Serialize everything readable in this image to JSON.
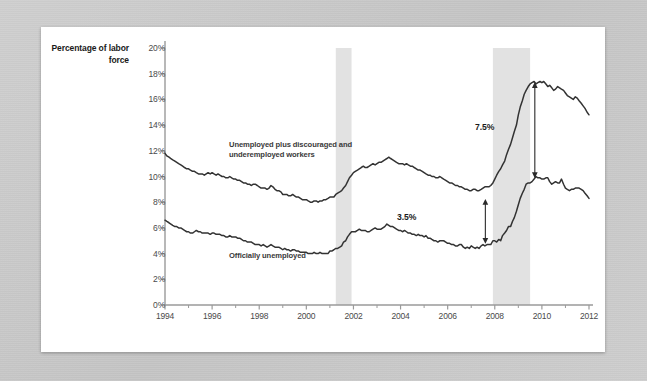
{
  "chart_data": {
    "type": "line",
    "title": "",
    "ylabel": "Percentage of labor force",
    "xlabel": "",
    "ylim": [
      0,
      20
    ],
    "xlim": [
      1994,
      2012
    ],
    "grid": false,
    "legend_position": "inline-annotations",
    "ytick_labels": [
      "0%",
      "2%",
      "4%",
      "6%",
      "8%",
      "10%",
      "12%",
      "14%",
      "16%",
      "18%",
      "20%"
    ],
    "ytick_values": [
      0,
      2,
      4,
      6,
      8,
      10,
      12,
      14,
      16,
      18,
      20
    ],
    "xtick_labels": [
      "1994",
      "1996",
      "1998",
      "2000",
      "2002",
      "2004",
      "2006",
      "2008",
      "2010",
      "2012"
    ],
    "xtick_values": [
      1994,
      1996,
      1998,
      2000,
      2002,
      2004,
      2006,
      2008,
      2010,
      2012
    ],
    "xtick_minor_values": [
      1995,
      1997,
      1999,
      2001,
      2003,
      2005,
      2007,
      2009,
      2011
    ],
    "series": [
      {
        "name": "Unemployed plus discouraged and underemployed workers",
        "color": "#333333",
        "x": [
          1994.0,
          1994.08,
          1994.17,
          1994.25,
          1994.33,
          1994.42,
          1994.5,
          1994.58,
          1994.67,
          1994.75,
          1994.83,
          1994.92,
          1995.0,
          1995.08,
          1995.17,
          1995.25,
          1995.33,
          1995.42,
          1995.5,
          1995.58,
          1995.67,
          1995.75,
          1995.83,
          1995.92,
          1996.0,
          1996.08,
          1996.17,
          1996.25,
          1996.33,
          1996.42,
          1996.5,
          1996.58,
          1996.67,
          1996.75,
          1996.83,
          1996.92,
          1997.0,
          1997.08,
          1997.17,
          1997.25,
          1997.33,
          1997.42,
          1997.5,
          1997.58,
          1997.67,
          1997.75,
          1997.83,
          1997.92,
          1998.0,
          1998.08,
          1998.17,
          1998.25,
          1998.33,
          1998.42,
          1998.5,
          1998.58,
          1998.67,
          1998.75,
          1998.83,
          1998.92,
          1999.0,
          1999.08,
          1999.17,
          1999.25,
          1999.33,
          1999.42,
          1999.5,
          1999.58,
          1999.67,
          1999.75,
          1999.83,
          1999.92,
          2000.0,
          2000.08,
          2000.17,
          2000.25,
          2000.33,
          2000.42,
          2000.5,
          2000.58,
          2000.67,
          2000.75,
          2000.83,
          2000.92,
          2001.0,
          2001.08,
          2001.17,
          2001.25,
          2001.33,
          2001.42,
          2001.5,
          2001.58,
          2001.67,
          2001.75,
          2001.83,
          2001.92,
          2002.0,
          2002.08,
          2002.17,
          2002.25,
          2002.33,
          2002.42,
          2002.5,
          2002.58,
          2002.67,
          2002.75,
          2002.83,
          2002.92,
          2003.0,
          2003.08,
          2003.17,
          2003.25,
          2003.33,
          2003.42,
          2003.5,
          2003.58,
          2003.67,
          2003.75,
          2003.83,
          2003.92,
          2004.0,
          2004.08,
          2004.17,
          2004.25,
          2004.33,
          2004.42,
          2004.5,
          2004.58,
          2004.67,
          2004.75,
          2004.83,
          2004.92,
          2005.0,
          2005.08,
          2005.17,
          2005.25,
          2005.33,
          2005.42,
          2005.5,
          2005.58,
          2005.67,
          2005.75,
          2005.83,
          2005.92,
          2006.0,
          2006.08,
          2006.17,
          2006.25,
          2006.33,
          2006.42,
          2006.5,
          2006.58,
          2006.67,
          2006.75,
          2006.83,
          2006.92,
          2007.0,
          2007.08,
          2007.17,
          2007.25,
          2007.33,
          2007.42,
          2007.5,
          2007.58,
          2007.67,
          2007.75,
          2007.83,
          2007.92,
          2008.0,
          2008.08,
          2008.17,
          2008.25,
          2008.33,
          2008.42,
          2008.5,
          2008.58,
          2008.67,
          2008.75,
          2008.83,
          2008.92,
          2009.0,
          2009.08,
          2009.17,
          2009.25,
          2009.33,
          2009.42,
          2009.5,
          2009.58,
          2009.67,
          2009.75,
          2009.83,
          2009.92,
          2010.0,
          2010.08,
          2010.17,
          2010.25,
          2010.33,
          2010.42,
          2010.5,
          2010.58,
          2010.67,
          2010.75,
          2010.83,
          2010.92,
          2011.0,
          2011.08,
          2011.17,
          2011.25,
          2011.33,
          2011.42,
          2011.5,
          2011.58,
          2011.67,
          2011.75,
          2011.83,
          2011.92,
          2012.0
        ],
        "values": [
          11.8,
          11.6,
          11.5,
          11.4,
          11.3,
          11.2,
          11.1,
          11.0,
          10.9,
          10.8,
          10.7,
          10.6,
          10.6,
          10.5,
          10.4,
          10.4,
          10.3,
          10.2,
          10.2,
          10.2,
          10.1,
          10.2,
          10.3,
          10.2,
          10.3,
          10.2,
          10.1,
          10.2,
          10.1,
          10.0,
          10.0,
          9.9,
          9.9,
          10.0,
          9.9,
          9.8,
          9.8,
          9.7,
          9.7,
          9.6,
          9.5,
          9.5,
          9.4,
          9.4,
          9.3,
          9.4,
          9.4,
          9.3,
          9.2,
          9.1,
          9.1,
          9.1,
          9.0,
          9.1,
          9.3,
          9.2,
          9.0,
          8.9,
          8.9,
          8.8,
          8.6,
          8.6,
          8.6,
          8.5,
          8.5,
          8.6,
          8.5,
          8.4,
          8.4,
          8.3,
          8.2,
          8.2,
          8.2,
          8.1,
          8.0,
          8.0,
          8.1,
          8.1,
          8.0,
          8.1,
          8.1,
          8.2,
          8.2,
          8.3,
          8.4,
          8.4,
          8.4,
          8.6,
          8.7,
          8.8,
          8.9,
          9.1,
          9.3,
          9.6,
          9.9,
          10.1,
          10.3,
          10.4,
          10.5,
          10.6,
          10.7,
          10.8,
          10.7,
          10.7,
          10.8,
          10.9,
          11.0,
          10.9,
          11.0,
          11.1,
          11.1,
          11.2,
          11.3,
          11.4,
          11.5,
          11.4,
          11.3,
          11.2,
          11.1,
          11.0,
          11.0,
          11.0,
          10.9,
          11.0,
          10.9,
          10.8,
          10.8,
          10.7,
          10.6,
          10.5,
          10.5,
          10.4,
          10.3,
          10.2,
          10.1,
          10.1,
          10.0,
          10.0,
          9.9,
          9.9,
          10.0,
          9.9,
          9.8,
          9.7,
          9.6,
          9.5,
          9.5,
          9.4,
          9.3,
          9.3,
          9.2,
          9.2,
          9.1,
          9.0,
          9.0,
          8.9,
          8.9,
          9.0,
          9.0,
          8.9,
          8.9,
          9.0,
          9.1,
          9.2,
          9.2,
          9.2,
          9.3,
          9.5,
          9.8,
          10.1,
          10.4,
          10.6,
          10.9,
          11.2,
          11.7,
          12.1,
          12.5,
          13.0,
          13.5,
          14.0,
          14.8,
          15.4,
          15.9,
          16.4,
          16.7,
          17.0,
          17.2,
          17.3,
          17.4,
          17.2,
          17.3,
          17.4,
          17.3,
          17.4,
          17.2,
          17.0,
          17.1,
          16.9,
          16.7,
          16.8,
          17.0,
          16.9,
          16.8,
          16.7,
          16.5,
          16.3,
          16.2,
          16.1,
          16.0,
          16.2,
          16.1,
          15.9,
          15.7,
          15.5,
          15.3,
          15.0,
          14.8
        ]
      },
      {
        "name": "Officially unemployed",
        "color": "#333333",
        "x": [
          1994.0,
          1994.08,
          1994.17,
          1994.25,
          1994.33,
          1994.42,
          1994.5,
          1994.58,
          1994.67,
          1994.75,
          1994.83,
          1994.92,
          1995.0,
          1995.08,
          1995.17,
          1995.25,
          1995.33,
          1995.42,
          1995.5,
          1995.58,
          1995.67,
          1995.75,
          1995.83,
          1995.92,
          1996.0,
          1996.08,
          1996.17,
          1996.25,
          1996.33,
          1996.42,
          1996.5,
          1996.58,
          1996.67,
          1996.75,
          1996.83,
          1996.92,
          1997.0,
          1997.08,
          1997.17,
          1997.25,
          1997.33,
          1997.42,
          1997.5,
          1997.58,
          1997.67,
          1997.75,
          1997.83,
          1997.92,
          1998.0,
          1998.08,
          1998.17,
          1998.25,
          1998.33,
          1998.42,
          1998.5,
          1998.58,
          1998.67,
          1998.75,
          1998.83,
          1998.92,
          1999.0,
          1999.08,
          1999.17,
          1999.25,
          1999.33,
          1999.42,
          1999.5,
          1999.58,
          1999.67,
          1999.75,
          1999.83,
          1999.92,
          2000.0,
          2000.08,
          2000.17,
          2000.25,
          2000.33,
          2000.42,
          2000.5,
          2000.58,
          2000.67,
          2000.75,
          2000.83,
          2000.92,
          2001.0,
          2001.08,
          2001.17,
          2001.25,
          2001.33,
          2001.42,
          2001.5,
          2001.58,
          2001.67,
          2001.75,
          2001.83,
          2001.92,
          2002.0,
          2002.08,
          2002.17,
          2002.25,
          2002.33,
          2002.42,
          2002.5,
          2002.58,
          2002.67,
          2002.75,
          2002.83,
          2002.92,
          2003.0,
          2003.08,
          2003.17,
          2003.25,
          2003.33,
          2003.42,
          2003.5,
          2003.58,
          2003.67,
          2003.75,
          2003.83,
          2003.92,
          2004.0,
          2004.08,
          2004.17,
          2004.25,
          2004.33,
          2004.42,
          2004.5,
          2004.58,
          2004.67,
          2004.75,
          2004.83,
          2004.92,
          2005.0,
          2005.08,
          2005.17,
          2005.25,
          2005.33,
          2005.42,
          2005.5,
          2005.58,
          2005.67,
          2005.75,
          2005.83,
          2005.92,
          2006.0,
          2006.08,
          2006.17,
          2006.25,
          2006.33,
          2006.42,
          2006.5,
          2006.58,
          2006.67,
          2006.75,
          2006.83,
          2006.92,
          2007.0,
          2007.08,
          2007.17,
          2007.25,
          2007.33,
          2007.42,
          2007.5,
          2007.58,
          2007.67,
          2007.75,
          2007.83,
          2007.92,
          2008.0,
          2008.08,
          2008.17,
          2008.25,
          2008.33,
          2008.42,
          2008.5,
          2008.58,
          2008.67,
          2008.75,
          2008.83,
          2008.92,
          2009.0,
          2009.08,
          2009.17,
          2009.25,
          2009.33,
          2009.42,
          2009.5,
          2009.58,
          2009.67,
          2009.75,
          2009.83,
          2009.92,
          2010.0,
          2010.08,
          2010.17,
          2010.25,
          2010.33,
          2010.42,
          2010.5,
          2010.58,
          2010.67,
          2010.75,
          2010.83,
          2010.92,
          2011.0,
          2011.08,
          2011.17,
          2011.25,
          2011.33,
          2011.42,
          2011.5,
          2011.58,
          2011.67,
          2011.75,
          2011.83,
          2011.92,
          2012.0
        ],
        "values": [
          6.6,
          6.5,
          6.4,
          6.3,
          6.2,
          6.1,
          6.1,
          6.0,
          6.0,
          5.9,
          5.8,
          5.7,
          5.7,
          5.6,
          5.6,
          5.7,
          5.8,
          5.7,
          5.7,
          5.6,
          5.6,
          5.6,
          5.6,
          5.5,
          5.6,
          5.6,
          5.5,
          5.5,
          5.5,
          5.4,
          5.4,
          5.3,
          5.3,
          5.4,
          5.3,
          5.3,
          5.3,
          5.2,
          5.2,
          5.1,
          5.0,
          5.0,
          4.9,
          4.9,
          4.9,
          4.8,
          4.7,
          4.7,
          4.7,
          4.6,
          4.7,
          4.6,
          4.5,
          4.6,
          4.7,
          4.6,
          4.5,
          4.5,
          4.5,
          4.4,
          4.3,
          4.4,
          4.3,
          4.3,
          4.2,
          4.3,
          4.3,
          4.2,
          4.2,
          4.1,
          4.1,
          4.1,
          4.1,
          4.0,
          4.0,
          4.0,
          4.1,
          4.0,
          4.0,
          4.1,
          4.0,
          4.0,
          4.0,
          4.0,
          4.2,
          4.2,
          4.3,
          4.4,
          4.4,
          4.5,
          4.6,
          4.9,
          5.0,
          5.3,
          5.5,
          5.7,
          5.7,
          5.7,
          5.8,
          5.9,
          5.8,
          5.8,
          5.8,
          5.7,
          5.7,
          5.8,
          5.9,
          6.0,
          5.9,
          5.9,
          5.9,
          6.0,
          6.1,
          6.3,
          6.2,
          6.1,
          6.1,
          6.0,
          5.9,
          5.8,
          5.8,
          5.7,
          5.8,
          5.7,
          5.6,
          5.6,
          5.5,
          5.5,
          5.4,
          5.5,
          5.4,
          5.4,
          5.3,
          5.4,
          5.2,
          5.2,
          5.1,
          5.0,
          5.0,
          4.9,
          5.0,
          5.0,
          5.0,
          4.9,
          4.8,
          4.8,
          4.7,
          4.7,
          4.6,
          4.6,
          4.7,
          4.7,
          4.5,
          4.4,
          4.5,
          4.4,
          4.6,
          4.5,
          4.4,
          4.5,
          4.4,
          4.6,
          4.7,
          4.6,
          4.7,
          4.7,
          4.7,
          5.0,
          5.0,
          4.9,
          5.1,
          5.0,
          5.4,
          5.6,
          5.8,
          6.1,
          6.1,
          6.5,
          6.8,
          7.3,
          7.8,
          8.3,
          8.7,
          9.0,
          9.4,
          9.5,
          9.5,
          9.6,
          9.8,
          10.0,
          9.9,
          9.9,
          9.8,
          9.8,
          9.9,
          9.9,
          9.6,
          9.4,
          9.5,
          9.6,
          9.5,
          9.5,
          9.8,
          9.4,
          9.1,
          9.0,
          8.9,
          9.0,
          9.0,
          9.1,
          9.1,
          9.1,
          9.0,
          8.9,
          8.7,
          8.5,
          8.3
        ]
      }
    ],
    "recession_bands": [
      {
        "label": "2001 recession",
        "start": 2001.25,
        "end": 2001.92
      },
      {
        "label": "2007-2009 recession",
        "start": 2007.92,
        "end": 2009.5
      }
    ],
    "annotations": [
      {
        "name": "broad-series-label",
        "text": "Unemployed plus discouraged and\nunderemployed workers"
      },
      {
        "name": "official-series-label",
        "text": "Officially unemployed"
      },
      {
        "name": "gap-2007",
        "text": "3.5%",
        "at_x": 2007.6,
        "from_y": 4.8,
        "to_y": 8.3
      },
      {
        "name": "gap-2010",
        "text": "7.5%",
        "at_x": 2009.7,
        "from_y": 9.9,
        "to_y": 17.4
      }
    ],
    "colors": {
      "band": "#e2e2e2",
      "axis": "#9a9a9a",
      "line": "#333333",
      "tick_text": "#4a4a4a",
      "title_text": "#1a1a1a",
      "card_bg": "#ffffff",
      "page_bg": "#c9c9c9"
    }
  }
}
